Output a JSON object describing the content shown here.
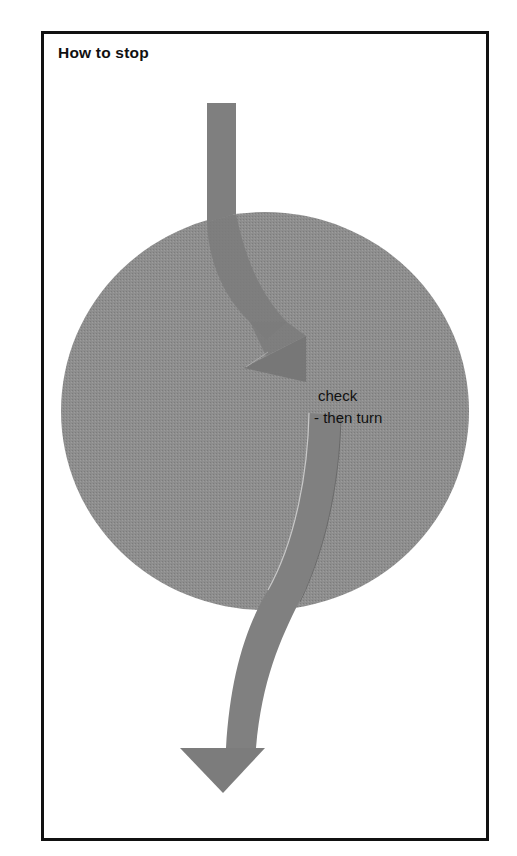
{
  "panel": {
    "title": "How to stop"
  },
  "diagram": {
    "circle_label": "roundabout",
    "annotation": {
      "line1": "check",
      "line2": "- then turn"
    },
    "arrows": [
      {
        "name": "approach-arrow",
        "direction": "down-right",
        "meaning": "approach and stop"
      },
      {
        "name": "exit-arrow",
        "direction": "down",
        "meaning": "turn and proceed"
      }
    ]
  },
  "colors": {
    "circle": "#8c8c8c",
    "arrow": "#7e7e7e",
    "frame": "#111111",
    "text": "#111111",
    "background": "#ffffff"
  }
}
